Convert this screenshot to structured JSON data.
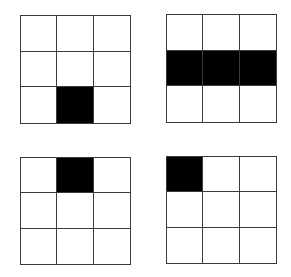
{
  "diagram": {
    "rows": 3,
    "cols": 3,
    "fill_color": "#000000",
    "empty_color": "#ffffff",
    "line_color": "#3a3a3a",
    "grids": [
      {
        "name": "grid-top-left",
        "filled": [
          [
            2,
            1
          ]
        ]
      },
      {
        "name": "grid-top-right",
        "filled": [
          [
            1,
            0
          ],
          [
            1,
            1
          ],
          [
            1,
            2
          ]
        ]
      },
      {
        "name": "grid-bottom-left",
        "filled": [
          [
            0,
            1
          ]
        ]
      },
      {
        "name": "grid-bottom-right",
        "filled": [
          [
            0,
            0
          ]
        ]
      }
    ]
  }
}
